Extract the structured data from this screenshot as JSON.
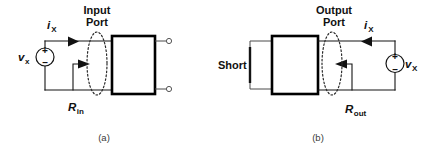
{
  "figure": {
    "background": "#ffffff",
    "ink_color": "#141414",
    "box_color": "#000000",
    "caption_color": "#3a3a3a"
  },
  "panel_a": {
    "caption": "(a)",
    "port_label_line1": "Input",
    "port_label_line2": "Port",
    "current_symbol": "i",
    "current_subscript": "X",
    "voltage_symbol": "v",
    "voltage_subscript": "x",
    "resistance_symbol": "R",
    "resistance_subscript": "in",
    "plus_sign": "+",
    "minus_sign": "–",
    "network_box_label": "",
    "icons": {
      "source": "voltage-source-icon",
      "port": "port-ellipse-icon",
      "current_arrow": "current-arrow-icon",
      "resistance_arrow": "resistance-arrow-icon",
      "terminal_top": "terminal-node-icon",
      "terminal_bottom": "terminal-node-icon"
    }
  },
  "panel_b": {
    "caption": "(b)",
    "port_label_line1": "Output",
    "port_label_line2": "Port",
    "current_symbol": "i",
    "current_subscript": "X",
    "voltage_symbol": "v",
    "voltage_subscript": "X",
    "resistance_symbol": "R",
    "resistance_subscript": "out",
    "short_label": "Short",
    "plus_sign": "+",
    "minus_sign": "–",
    "network_box_label": "",
    "icons": {
      "source": "voltage-source-icon",
      "port": "port-ellipse-icon",
      "current_arrow": "current-arrow-icon",
      "resistance_arrow": "resistance-arrow-icon",
      "short_bar": "short-circuit-icon"
    }
  }
}
